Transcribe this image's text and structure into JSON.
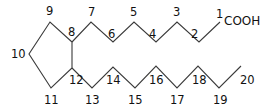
{
  "diagram": {
    "type": "skeletal-formula",
    "functional_group": "COOH",
    "atoms": [
      {
        "n": "1",
        "x": 220,
        "y": 22
      },
      {
        "n": "2",
        "x": 199,
        "y": 42
      },
      {
        "n": "3",
        "x": 177,
        "y": 22
      },
      {
        "n": "4",
        "x": 156,
        "y": 42
      },
      {
        "n": "5",
        "x": 134,
        "y": 22
      },
      {
        "n": "6",
        "x": 113,
        "y": 42
      },
      {
        "n": "7",
        "x": 91,
        "y": 22
      },
      {
        "n": "8",
        "x": 72,
        "y": 42
      },
      {
        "n": "9",
        "x": 50,
        "y": 22
      },
      {
        "n": "10",
        "x": 29,
        "y": 54
      },
      {
        "n": "11",
        "x": 51,
        "y": 88
      },
      {
        "n": "12",
        "x": 72,
        "y": 68
      },
      {
        "n": "13",
        "x": 92,
        "y": 88
      },
      {
        "n": "14",
        "x": 113,
        "y": 67
      },
      {
        "n": "15",
        "x": 135,
        "y": 88
      },
      {
        "n": "16",
        "x": 156,
        "y": 66
      },
      {
        "n": "17",
        "x": 177,
        "y": 88
      },
      {
        "n": "18",
        "x": 198,
        "y": 66
      },
      {
        "n": "19",
        "x": 219,
        "y": 88
      },
      {
        "n": "20",
        "x": 241,
        "y": 66
      }
    ],
    "labels": {
      "l1": "1",
      "l2": "2",
      "l3": "3",
      "l4": "4",
      "l5": "5",
      "l6": "6",
      "l7": "7",
      "l8": "8",
      "l9": "9",
      "l10": "10",
      "l11": "11",
      "l12": "12",
      "l13": "13",
      "l14": "14",
      "l15": "15",
      "l16": "16",
      "l17": "17",
      "l18": "18",
      "l19": "19",
      "l20": "20"
    },
    "bond_color": "#3a3a3a",
    "text_color": "#111111"
  }
}
